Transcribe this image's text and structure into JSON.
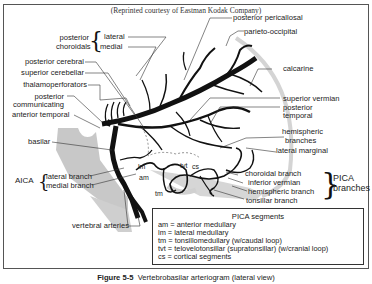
{
  "credit": "(Reprinted courtesy of Eastman Kodak Company)",
  "labels_left": {
    "posterior_choroidals": "posterior\nchoroidals",
    "posterior_choroidals_l1": "posterior",
    "posterior_choroidals_l2": "choroidals",
    "lateral": "lateral",
    "medial": "medial",
    "posterior_cerebral": "posterior cerebral",
    "superior_cerebellar": "superior cerebellar",
    "thalamoperforators": "thalamoperforators",
    "posterior_communicating_l1": "posterior",
    "posterior_communicating_l2": "communicating",
    "anterior_temporal": "anterior temporal",
    "basilar": "basilar",
    "aica": "AICA",
    "aica_lateral": "lateral branch",
    "aica_medial": "medial branch",
    "vertebral_arteries": "vertebral arteries"
  },
  "labels_right": {
    "posterior_pericallosal": "posterior pericallosal",
    "parieto_occipital": "parieto-occipital",
    "calcarine": "calcarine",
    "superior_vermian": "superior vermian",
    "posterior_temporal_l1": "posterior",
    "posterior_temporal_l2": "temporal",
    "hemispheric_branches_l1": "hemispheric",
    "hemispheric_branches_l2": "branches",
    "lateral_marginal": "lateral marginal",
    "choroidal_branch": "choroidal branch",
    "inferior_vermian": "inferior vermian",
    "hemispheric_branch": "hemispheric branch",
    "tonsillar_branch": "tonsillar branch",
    "pica_l1": "PICA",
    "pica_l2": "branches"
  },
  "segment_marks": {
    "lm": "lm",
    "am": "am",
    "tm": "tm",
    "tvt": "tvt",
    "cs": "cs"
  },
  "pica_segments": {
    "title": "PICA segments",
    "items": [
      "am = anterior medullary",
      "lm = lateral medullary",
      "tm = tonsillomedullary (w/caudal loop)",
      "tvt = telovelotonsillar (supratonsillar) (w/cranial loop)",
      "cs = cortical segments"
    ]
  },
  "caption": {
    "figure": "Figure 5-5",
    "text": "Vertebrobasilar arteriogram (lateral view)"
  }
}
